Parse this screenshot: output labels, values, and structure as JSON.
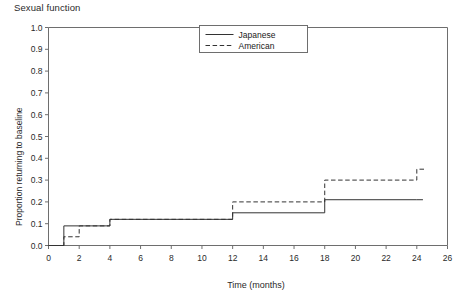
{
  "chart_data": {
    "type": "line",
    "title": "Sexual function",
    "subtitle": "",
    "xlabel": "Time (months)",
    "ylabel": "Proportion returning to baseline",
    "xlim": [
      0,
      26
    ],
    "ylim": [
      0,
      1.0
    ],
    "xticks": [
      0,
      2,
      4,
      6,
      8,
      10,
      12,
      14,
      16,
      18,
      20,
      22,
      24,
      26
    ],
    "xticklabels": [
      "0",
      "2",
      "4",
      "6",
      "8",
      "10",
      "12",
      "14",
      "16",
      "18",
      "20",
      "22",
      "24",
      "26"
    ],
    "yticks": [
      0.0,
      0.1,
      0.2,
      0.3,
      0.4,
      0.5,
      0.6,
      0.7,
      0.8,
      0.9,
      1.0
    ],
    "yticklabels": [
      "0.0",
      "0.1",
      "0.2",
      "0.3",
      "0.4",
      "0.5",
      "0.6",
      "0.7",
      "0.8",
      "0.9",
      "1.0"
    ],
    "grid": false,
    "step_type": "post",
    "legend_position": "top-center",
    "series": [
      {
        "name": "Japanese",
        "style": "solid",
        "color": "#333333",
        "x": [
          0,
          1,
          2,
          4,
          12,
          18,
          24
        ],
        "y": [
          0.0,
          0.09,
          0.09,
          0.12,
          0.15,
          0.21,
          0.21
        ],
        "x_end": 24.4
      },
      {
        "name": "American",
        "style": "dashed",
        "color": "#333333",
        "x": [
          0,
          1,
          2,
          4,
          12,
          18,
          24
        ],
        "y": [
          0.0,
          0.04,
          0.09,
          0.12,
          0.2,
          0.3,
          0.35
        ],
        "x_end": 24.6
      }
    ]
  },
  "legend": {
    "entries": [
      {
        "label": "Japanese",
        "style": "solid"
      },
      {
        "label": "American",
        "style": "dashed"
      }
    ]
  },
  "footer": {
    "note": ""
  }
}
